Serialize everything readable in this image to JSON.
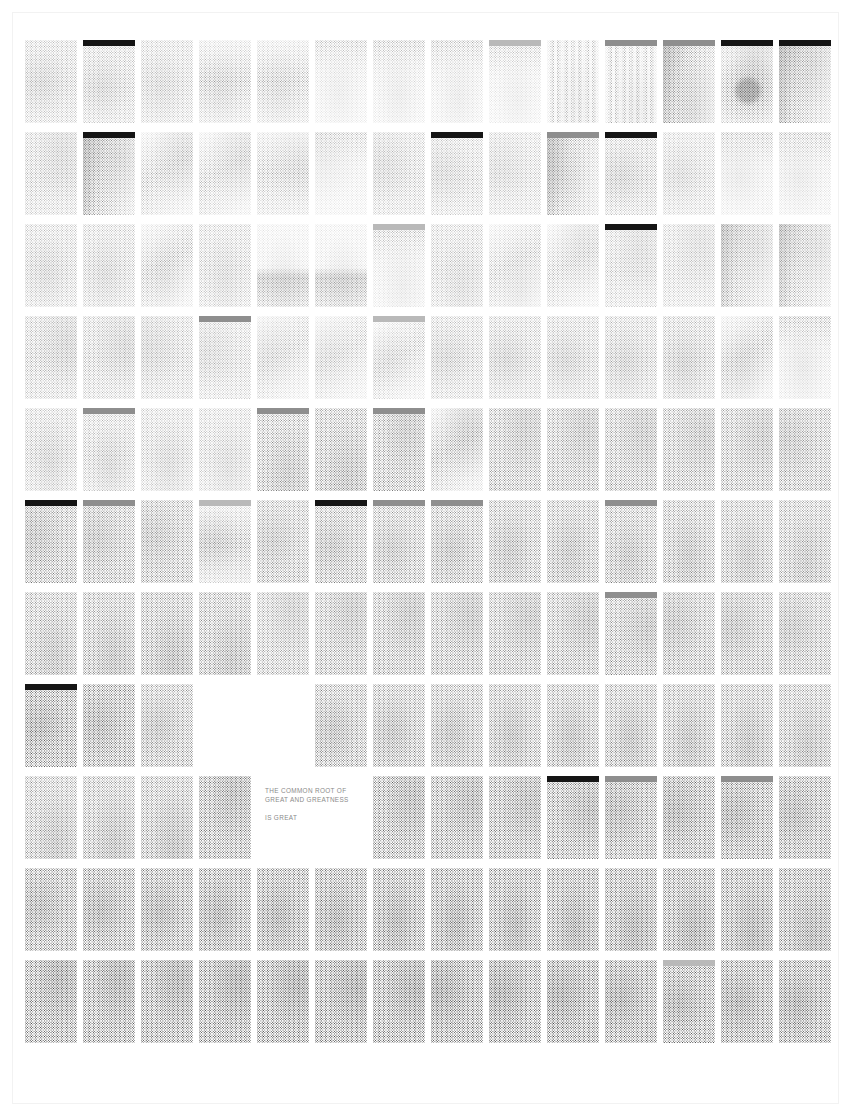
{
  "page": {
    "background_color": "#ffffff",
    "width": 851,
    "height": 1116,
    "frame_color": "#f2f2f2"
  },
  "grid": {
    "columns": 14,
    "rows": 11,
    "card_width": 52,
    "card_height": 83,
    "column_pitch": 58,
    "row_pitch": 92,
    "origin_x": 25,
    "origin_y": 40,
    "dot_color": "#222222",
    "bar_black": "#151515",
    "bar_gray": "#8e8e8e",
    "bar_light_gray": "#b9b9b9"
  },
  "text_panel": {
    "row": 8,
    "start_column": 4,
    "span_columns": 2,
    "background_color": "#ffffff",
    "text_color": "#8a8a8a",
    "line1": "THE COMMON ROOT OF",
    "line2": "GREAT AND GREATNESS",
    "line3": "IS GREAT"
  },
  "cards": [
    {
      "r": 0,
      "c": 0,
      "d": 0.3,
      "bar": "none",
      "img": "noise-light"
    },
    {
      "r": 0,
      "c": 1,
      "d": 0.3,
      "bar": "black",
      "img": "noise-light"
    },
    {
      "r": 0,
      "c": 2,
      "d": 0.26,
      "bar": "none",
      "img": "noise-light"
    },
    {
      "r": 0,
      "c": 3,
      "d": 0.24,
      "bar": "none",
      "img": "gradient-down"
    },
    {
      "r": 0,
      "c": 4,
      "d": 0.22,
      "bar": "none",
      "img": "gradient-down"
    },
    {
      "r": 0,
      "c": 5,
      "d": 0.18,
      "bar": "none",
      "img": "soft-top"
    },
    {
      "r": 0,
      "c": 6,
      "d": 0.2,
      "bar": "none",
      "img": "soft-top"
    },
    {
      "r": 0,
      "c": 7,
      "d": 0.2,
      "bar": "none",
      "img": "soft-top"
    },
    {
      "r": 0,
      "c": 8,
      "d": 0.16,
      "bar": "light",
      "img": "soft-top"
    },
    {
      "r": 0,
      "c": 9,
      "d": 0.18,
      "bar": "none",
      "img": "vert-streak"
    },
    {
      "r": 0,
      "c": 10,
      "d": 0.2,
      "bar": "gray",
      "img": "vert-streak"
    },
    {
      "r": 0,
      "c": 11,
      "d": 0.34,
      "bar": "gray",
      "img": "photo-dark-left"
    },
    {
      "r": 0,
      "c": 12,
      "d": 0.4,
      "bar": "black",
      "img": "star"
    },
    {
      "r": 0,
      "c": 13,
      "d": 0.34,
      "bar": "black",
      "img": "photo-dark-left"
    },
    {
      "r": 1,
      "c": 0,
      "d": 0.3,
      "bar": "none",
      "img": "noise-light"
    },
    {
      "r": 1,
      "c": 1,
      "d": 0.34,
      "bar": "black",
      "img": "photo-dark-left"
    },
    {
      "r": 1,
      "c": 2,
      "d": 0.26,
      "bar": "none",
      "img": "diag-light"
    },
    {
      "r": 1,
      "c": 3,
      "d": 0.24,
      "bar": "none",
      "img": "diag-light"
    },
    {
      "r": 1,
      "c": 4,
      "d": 0.22,
      "bar": "none",
      "img": "gradient-down"
    },
    {
      "r": 1,
      "c": 5,
      "d": 0.18,
      "bar": "none",
      "img": "soft-top"
    },
    {
      "r": 1,
      "c": 6,
      "d": 0.26,
      "bar": "none",
      "img": "noise-light"
    },
    {
      "r": 1,
      "c": 7,
      "d": 0.26,
      "bar": "black",
      "img": "noise-light"
    },
    {
      "r": 1,
      "c": 8,
      "d": 0.24,
      "bar": "none",
      "img": "noise-light"
    },
    {
      "r": 1,
      "c": 9,
      "d": 0.3,
      "bar": "gray",
      "img": "photo-dark-left"
    },
    {
      "r": 1,
      "c": 10,
      "d": 0.32,
      "bar": "black",
      "img": "noise-light"
    },
    {
      "r": 1,
      "c": 11,
      "d": 0.24,
      "bar": "none",
      "img": "noise-light"
    },
    {
      "r": 1,
      "c": 12,
      "d": 0.22,
      "bar": "none",
      "img": "soft-top"
    },
    {
      "r": 1,
      "c": 13,
      "d": 0.22,
      "bar": "none",
      "img": "soft-top"
    },
    {
      "r": 2,
      "c": 0,
      "d": 0.28,
      "bar": "none",
      "img": "noise-light"
    },
    {
      "r": 2,
      "c": 1,
      "d": 0.28,
      "bar": "none",
      "img": "noise-light"
    },
    {
      "r": 2,
      "c": 2,
      "d": 0.26,
      "bar": "none",
      "img": "diag-light"
    },
    {
      "r": 2,
      "c": 3,
      "d": 0.26,
      "bar": "none",
      "img": "noise-light"
    },
    {
      "r": 2,
      "c": 4,
      "d": 0.24,
      "bar": "none",
      "img": "navy-text"
    },
    {
      "r": 2,
      "c": 5,
      "d": 0.24,
      "bar": "none",
      "img": "navy-text"
    },
    {
      "r": 2,
      "c": 6,
      "d": 0.2,
      "bar": "light",
      "img": "soft-top"
    },
    {
      "r": 2,
      "c": 7,
      "d": 0.26,
      "bar": "none",
      "img": "noise-light"
    },
    {
      "r": 2,
      "c": 8,
      "d": 0.22,
      "bar": "none",
      "img": "diag-light"
    },
    {
      "r": 2,
      "c": 9,
      "d": 0.22,
      "bar": "none",
      "img": "diag-light"
    },
    {
      "r": 2,
      "c": 10,
      "d": 0.26,
      "bar": "black",
      "img": "noise-light"
    },
    {
      "r": 2,
      "c": 11,
      "d": 0.24,
      "bar": "none",
      "img": "noise-light"
    },
    {
      "r": 2,
      "c": 12,
      "d": 0.26,
      "bar": "none",
      "img": "photo-dark-left"
    },
    {
      "r": 2,
      "c": 13,
      "d": 0.26,
      "bar": "none",
      "img": "photo-dark-left"
    },
    {
      "r": 3,
      "c": 0,
      "d": 0.34,
      "bar": "none",
      "img": "noise-light"
    },
    {
      "r": 3,
      "c": 1,
      "d": 0.32,
      "bar": "none",
      "img": "noise-light"
    },
    {
      "r": 3,
      "c": 2,
      "d": 0.3,
      "bar": "none",
      "img": "noise-light"
    },
    {
      "r": 3,
      "c": 3,
      "d": 0.26,
      "bar": "gray",
      "img": "noise-light"
    },
    {
      "r": 3,
      "c": 4,
      "d": 0.22,
      "bar": "none",
      "img": "diag-light"
    },
    {
      "r": 3,
      "c": 5,
      "d": 0.2,
      "bar": "none",
      "img": "diag-light"
    },
    {
      "r": 3,
      "c": 6,
      "d": 0.22,
      "bar": "light",
      "img": "diag-light"
    },
    {
      "r": 3,
      "c": 7,
      "d": 0.3,
      "bar": "none",
      "img": "noise-light"
    },
    {
      "r": 3,
      "c": 8,
      "d": 0.32,
      "bar": "none",
      "img": "noise-light"
    },
    {
      "r": 3,
      "c": 9,
      "d": 0.32,
      "bar": "none",
      "img": "noise-light"
    },
    {
      "r": 3,
      "c": 10,
      "d": 0.34,
      "bar": "none",
      "img": "noise-light"
    },
    {
      "r": 3,
      "c": 11,
      "d": 0.36,
      "bar": "none",
      "img": "noise-light"
    },
    {
      "r": 3,
      "c": 12,
      "d": 0.3,
      "bar": "none",
      "img": "diag-light"
    },
    {
      "r": 3,
      "c": 13,
      "d": 0.26,
      "bar": "none",
      "img": "soft-top"
    },
    {
      "r": 4,
      "c": 0,
      "d": 0.32,
      "bar": "none",
      "img": "noise-light"
    },
    {
      "r": 4,
      "c": 1,
      "d": 0.32,
      "bar": "gray",
      "img": "noise-light"
    },
    {
      "r": 4,
      "c": 2,
      "d": 0.28,
      "bar": "none",
      "img": "noise-light"
    },
    {
      "r": 4,
      "c": 3,
      "d": 0.26,
      "bar": "none",
      "img": "noise-light"
    },
    {
      "r": 4,
      "c": 4,
      "d": 0.38,
      "bar": "gray",
      "img": "noise-mid"
    },
    {
      "r": 4,
      "c": 5,
      "d": 0.4,
      "bar": "none",
      "img": "noise-mid"
    },
    {
      "r": 4,
      "c": 6,
      "d": 0.4,
      "bar": "gray",
      "img": "noise-mid"
    },
    {
      "r": 4,
      "c": 7,
      "d": 0.38,
      "bar": "none",
      "img": "diag-light"
    },
    {
      "r": 4,
      "c": 8,
      "d": 0.38,
      "bar": "none",
      "img": "noise-mid"
    },
    {
      "r": 4,
      "c": 9,
      "d": 0.38,
      "bar": "none",
      "img": "noise-mid"
    },
    {
      "r": 4,
      "c": 10,
      "d": 0.38,
      "bar": "none",
      "img": "noise-mid"
    },
    {
      "r": 4,
      "c": 11,
      "d": 0.38,
      "bar": "none",
      "img": "noise-mid"
    },
    {
      "r": 4,
      "c": 12,
      "d": 0.38,
      "bar": "none",
      "img": "noise-mid"
    },
    {
      "r": 4,
      "c": 13,
      "d": 0.38,
      "bar": "none",
      "img": "noise-mid"
    },
    {
      "r": 5,
      "c": 0,
      "d": 0.42,
      "bar": "black",
      "img": "noise-mid"
    },
    {
      "r": 5,
      "c": 1,
      "d": 0.4,
      "bar": "gray",
      "img": "noise-mid"
    },
    {
      "r": 5,
      "c": 2,
      "d": 0.38,
      "bar": "none",
      "img": "noise-mid"
    },
    {
      "r": 5,
      "c": 3,
      "d": 0.34,
      "bar": "light",
      "img": "gradient-down"
    },
    {
      "r": 5,
      "c": 4,
      "d": 0.36,
      "bar": "none",
      "img": "noise-mid"
    },
    {
      "r": 5,
      "c": 5,
      "d": 0.4,
      "bar": "black",
      "img": "noise-mid"
    },
    {
      "r": 5,
      "c": 6,
      "d": 0.38,
      "bar": "gray",
      "img": "noise-mid"
    },
    {
      "r": 5,
      "c": 7,
      "d": 0.4,
      "bar": "gray",
      "img": "noise-mid"
    },
    {
      "r": 5,
      "c": 8,
      "d": 0.4,
      "bar": "none",
      "img": "noise-mid"
    },
    {
      "r": 5,
      "c": 9,
      "d": 0.4,
      "bar": "none",
      "img": "noise-mid"
    },
    {
      "r": 5,
      "c": 10,
      "d": 0.4,
      "bar": "gray",
      "img": "noise-mid"
    },
    {
      "r": 5,
      "c": 11,
      "d": 0.4,
      "bar": "none",
      "img": "noise-mid"
    },
    {
      "r": 5,
      "c": 12,
      "d": 0.38,
      "bar": "none",
      "img": "noise-mid"
    },
    {
      "r": 5,
      "c": 13,
      "d": 0.38,
      "bar": "none",
      "img": "noise-mid"
    },
    {
      "r": 6,
      "c": 0,
      "d": 0.4,
      "bar": "none",
      "img": "noise-mid"
    },
    {
      "r": 6,
      "c": 1,
      "d": 0.42,
      "bar": "none",
      "img": "noise-mid"
    },
    {
      "r": 6,
      "c": 2,
      "d": 0.44,
      "bar": "none",
      "img": "noise-mid"
    },
    {
      "r": 6,
      "c": 3,
      "d": 0.42,
      "bar": "none",
      "img": "noise-mid"
    },
    {
      "r": 6,
      "c": 4,
      "d": 0.34,
      "bar": "none",
      "img": "noise-mid"
    },
    {
      "r": 6,
      "c": 5,
      "d": 0.4,
      "bar": "none",
      "img": "noise-mid"
    },
    {
      "r": 6,
      "c": 6,
      "d": 0.42,
      "bar": "none",
      "img": "noise-mid"
    },
    {
      "r": 6,
      "c": 7,
      "d": 0.42,
      "bar": "none",
      "img": "noise-mid"
    },
    {
      "r": 6,
      "c": 8,
      "d": 0.42,
      "bar": "none",
      "img": "noise-mid"
    },
    {
      "r": 6,
      "c": 9,
      "d": 0.42,
      "bar": "none",
      "img": "noise-mid"
    },
    {
      "r": 6,
      "c": 10,
      "d": 0.42,
      "bar": "gray",
      "img": "noise-mid"
    },
    {
      "r": 6,
      "c": 11,
      "d": 0.42,
      "bar": "none",
      "img": "noise-mid"
    },
    {
      "r": 6,
      "c": 12,
      "d": 0.42,
      "bar": "none",
      "img": "noise-mid"
    },
    {
      "r": 6,
      "c": 13,
      "d": 0.4,
      "bar": "none",
      "img": "noise-mid"
    },
    {
      "r": 7,
      "c": 0,
      "d": 0.48,
      "bar": "black",
      "img": "noise-dark"
    },
    {
      "r": 7,
      "c": 1,
      "d": 0.46,
      "bar": "none",
      "img": "noise-dark"
    },
    {
      "r": 7,
      "c": 2,
      "d": 0.42,
      "bar": "none",
      "img": "noise-mid"
    },
    {
      "r": 7,
      "c": 5,
      "d": 0.44,
      "bar": "none",
      "img": "noise-mid"
    },
    {
      "r": 7,
      "c": 6,
      "d": 0.44,
      "bar": "none",
      "img": "noise-mid"
    },
    {
      "r": 7,
      "c": 7,
      "d": 0.44,
      "bar": "none",
      "img": "noise-mid"
    },
    {
      "r": 7,
      "c": 8,
      "d": 0.44,
      "bar": "none",
      "img": "noise-mid"
    },
    {
      "r": 7,
      "c": 9,
      "d": 0.44,
      "bar": "none",
      "img": "noise-mid"
    },
    {
      "r": 7,
      "c": 10,
      "d": 0.44,
      "bar": "none",
      "img": "noise-mid"
    },
    {
      "r": 7,
      "c": 11,
      "d": 0.44,
      "bar": "none",
      "img": "noise-mid"
    },
    {
      "r": 7,
      "c": 12,
      "d": 0.44,
      "bar": "none",
      "img": "noise-mid"
    },
    {
      "r": 7,
      "c": 13,
      "d": 0.42,
      "bar": "none",
      "img": "noise-mid"
    },
    {
      "r": 8,
      "c": 0,
      "d": 0.4,
      "bar": "none",
      "img": "noise-mid"
    },
    {
      "r": 8,
      "c": 1,
      "d": 0.42,
      "bar": "none",
      "img": "noise-mid"
    },
    {
      "r": 8,
      "c": 2,
      "d": 0.44,
      "bar": "none",
      "img": "noise-mid"
    },
    {
      "r": 8,
      "c": 3,
      "d": 0.46,
      "bar": "none",
      "img": "noise-dark"
    },
    {
      "r": 8,
      "c": 4,
      "d": 0.46,
      "bar": "none",
      "img": "noise-dark"
    },
    {
      "r": 8,
      "c": 5,
      "d": 0.46,
      "bar": "none",
      "img": "noise-dark"
    },
    {
      "r": 8,
      "c": 6,
      "d": 0.46,
      "bar": "none",
      "img": "noise-dark"
    },
    {
      "r": 8,
      "c": 7,
      "d": 0.46,
      "bar": "none",
      "img": "noise-dark"
    },
    {
      "r": 8,
      "c": 8,
      "d": 0.46,
      "bar": "none",
      "img": "noise-dark"
    },
    {
      "r": 8,
      "c": 9,
      "d": 0.46,
      "bar": "black",
      "img": "noise-dark"
    },
    {
      "r": 8,
      "c": 10,
      "d": 0.46,
      "bar": "gray",
      "img": "noise-dark"
    },
    {
      "r": 8,
      "c": 11,
      "d": 0.48,
      "bar": "none",
      "img": "noise-dark"
    },
    {
      "r": 8,
      "c": 12,
      "d": 0.48,
      "bar": "gray",
      "img": "noise-dark"
    },
    {
      "r": 8,
      "c": 13,
      "d": 0.46,
      "bar": "none",
      "img": "noise-dark"
    },
    {
      "r": 9,
      "c": 0,
      "d": 0.46,
      "bar": "none",
      "img": "noise-dark"
    },
    {
      "r": 9,
      "c": 1,
      "d": 0.48,
      "bar": "none",
      "img": "noise-dark"
    },
    {
      "r": 9,
      "c": 2,
      "d": 0.48,
      "bar": "none",
      "img": "noise-dark"
    },
    {
      "r": 9,
      "c": 3,
      "d": 0.5,
      "bar": "none",
      "img": "noise-dark"
    },
    {
      "r": 9,
      "c": 4,
      "d": 0.5,
      "bar": "none",
      "img": "noise-dark"
    },
    {
      "r": 9,
      "c": 5,
      "d": 0.5,
      "bar": "none",
      "img": "noise-dark"
    },
    {
      "r": 9,
      "c": 6,
      "d": 0.5,
      "bar": "none",
      "img": "noise-dark"
    },
    {
      "r": 9,
      "c": 7,
      "d": 0.5,
      "bar": "none",
      "img": "noise-dark"
    },
    {
      "r": 9,
      "c": 8,
      "d": 0.5,
      "bar": "none",
      "img": "noise-dark"
    },
    {
      "r": 9,
      "c": 9,
      "d": 0.5,
      "bar": "none",
      "img": "noise-dark"
    },
    {
      "r": 9,
      "c": 10,
      "d": 0.5,
      "bar": "none",
      "img": "noise-dark"
    },
    {
      "r": 9,
      "c": 11,
      "d": 0.5,
      "bar": "none",
      "img": "noise-dark"
    },
    {
      "r": 9,
      "c": 12,
      "d": 0.5,
      "bar": "none",
      "img": "noise-dark"
    },
    {
      "r": 9,
      "c": 13,
      "d": 0.48,
      "bar": "none",
      "img": "noise-dark"
    },
    {
      "r": 10,
      "c": 0,
      "d": 0.52,
      "bar": "none",
      "img": "noise-dark"
    },
    {
      "r": 10,
      "c": 1,
      "d": 0.52,
      "bar": "none",
      "img": "noise-dark"
    },
    {
      "r": 10,
      "c": 2,
      "d": 0.52,
      "bar": "none",
      "img": "noise-dark"
    },
    {
      "r": 10,
      "c": 3,
      "d": 0.54,
      "bar": "none",
      "img": "noise-dark"
    },
    {
      "r": 10,
      "c": 4,
      "d": 0.54,
      "bar": "none",
      "img": "noise-dark"
    },
    {
      "r": 10,
      "c": 5,
      "d": 0.54,
      "bar": "none",
      "img": "noise-dark"
    },
    {
      "r": 10,
      "c": 6,
      "d": 0.54,
      "bar": "none",
      "img": "noise-dark"
    },
    {
      "r": 10,
      "c": 7,
      "d": 0.54,
      "bar": "none",
      "img": "noise-dark"
    },
    {
      "r": 10,
      "c": 8,
      "d": 0.54,
      "bar": "none",
      "img": "noise-dark"
    },
    {
      "r": 10,
      "c": 9,
      "d": 0.54,
      "bar": "none",
      "img": "noise-dark"
    },
    {
      "r": 10,
      "c": 10,
      "d": 0.52,
      "bar": "none",
      "img": "noise-dark"
    },
    {
      "r": 10,
      "c": 11,
      "d": 0.5,
      "bar": "light",
      "img": "noise-dark"
    },
    {
      "r": 10,
      "c": 12,
      "d": 0.52,
      "bar": "none",
      "img": "noise-dark"
    },
    {
      "r": 10,
      "c": 13,
      "d": 0.52,
      "bar": "none",
      "img": "noise-dark"
    }
  ]
}
